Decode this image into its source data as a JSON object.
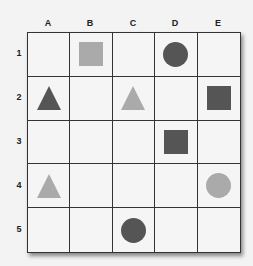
{
  "columns": [
    "A",
    "B",
    "C",
    "D",
    "E"
  ],
  "rows": [
    "1",
    "2",
    "3",
    "4",
    "5"
  ],
  "colors": {
    "dark": "#555555",
    "light": "#aaaaaa",
    "grid_line": "#333333",
    "background": "#f5f5f5"
  },
  "shapes": [
    {
      "row": 1,
      "col": "B",
      "type": "square",
      "shade": "light"
    },
    {
      "row": 1,
      "col": "D",
      "type": "circle",
      "shade": "dark"
    },
    {
      "row": 2,
      "col": "A",
      "type": "triangle",
      "shade": "dark"
    },
    {
      "row": 2,
      "col": "C",
      "type": "triangle",
      "shade": "light"
    },
    {
      "row": 2,
      "col": "E",
      "type": "square",
      "shade": "dark"
    },
    {
      "row": 3,
      "col": "D",
      "type": "square",
      "shade": "dark"
    },
    {
      "row": 4,
      "col": "A",
      "type": "triangle",
      "shade": "light"
    },
    {
      "row": 4,
      "col": "E",
      "type": "circle",
      "shade": "light"
    },
    {
      "row": 5,
      "col": "C",
      "type": "circle",
      "shade": "dark"
    }
  ]
}
